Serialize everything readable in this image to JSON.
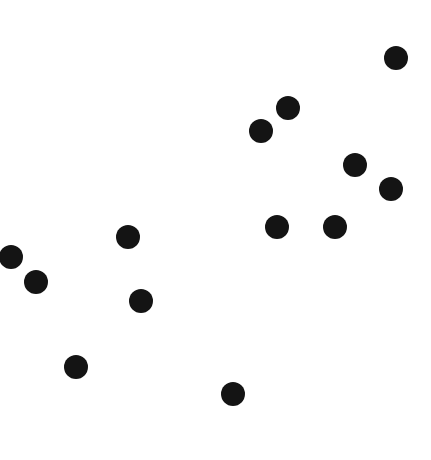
{
  "canvas": {
    "width": 431,
    "height": 460,
    "background_color": "#ffffff",
    "title": "",
    "axes_visible": false,
    "gridlines_visible": false,
    "legend_visible": false,
    "labels_visible": false
  },
  "marker_style": {
    "shape": "circle",
    "fill_color": "#141414",
    "edge_color": "#141414",
    "radius_px": 12,
    "opacity": 1
  },
  "chart_data": {
    "type": "scatter",
    "title": "",
    "xlabel": "",
    "ylabel": "",
    "xlim": [
      0,
      431
    ],
    "ylim": [
      0,
      460
    ],
    "grid": false,
    "legend": false,
    "axes": false,
    "point_count": 13,
    "units": "pixels (y measured from top of canvas)",
    "series": [
      {
        "name": "points",
        "color": "#141414",
        "marker": "o",
        "marker_radius": 12,
        "points": [
          {
            "id": "p1",
            "x": 396,
            "y": 58,
            "r": 12
          },
          {
            "id": "p2",
            "x": 288,
            "y": 108,
            "r": 12
          },
          {
            "id": "p3",
            "x": 261,
            "y": 131,
            "r": 12
          },
          {
            "id": "p4",
            "x": 355,
            "y": 165,
            "r": 12
          },
          {
            "id": "p5",
            "x": 391,
            "y": 189,
            "r": 12
          },
          {
            "id": "p6",
            "x": 277,
            "y": 227,
            "r": 12
          },
          {
            "id": "p7",
            "x": 335,
            "y": 227,
            "r": 12
          },
          {
            "id": "p8",
            "x": 128,
            "y": 237,
            "r": 12
          },
          {
            "id": "p9",
            "x": 11,
            "y": 257,
            "r": 12
          },
          {
            "id": "p10",
            "x": 36,
            "y": 282,
            "r": 12
          },
          {
            "id": "p11",
            "x": 141,
            "y": 301,
            "r": 12
          },
          {
            "id": "p12",
            "x": 76,
            "y": 367,
            "r": 12
          },
          {
            "id": "p13",
            "x": 233,
            "y": 394,
            "r": 12
          }
        ]
      }
    ]
  }
}
